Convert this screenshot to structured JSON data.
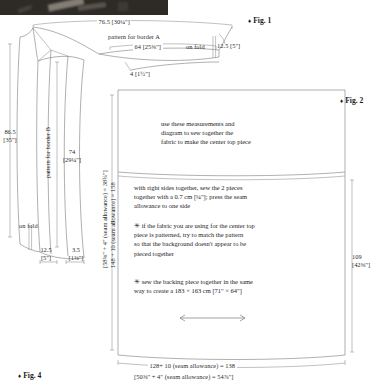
{
  "figure": {
    "doc_kind": "sewing-pattern-diagram",
    "photo_caption": "",
    "fig1_label": "Fig. 1",
    "fig2_label": "Fig. 2",
    "fig4_label": "Fig. 4",
    "bullet_glyph": "♦"
  },
  "border_a": {
    "title": "pattern for border A",
    "top_width": "76.5 [30¼\"]",
    "inner_width": "64 [25⅜\"]",
    "on_fold": "on fold",
    "fold_width": "12.5 [5\"]",
    "notch": "4 [1½\"]"
  },
  "border_b": {
    "title": "pattern for border B",
    "outer_height_line1": "86.5",
    "outer_height_line2": "[35\"]",
    "inner_height_line1": "74",
    "inner_height_line2": "[29¼\"]",
    "on_fold": "on fold",
    "left_width_line1": "12.5",
    "left_width_line2": "[5\"]",
    "right_width_line1": "3.5",
    "right_width_line2": "[1⅜\"]"
  },
  "center_top": {
    "height_metric": "148 + 10 (seam allowance) = 158",
    "height_imperial": "[58⅜\" + 4\" (seam allowance) = 38¾\"]",
    "bottom_metric": "128+ 10 (seam allowance) = 138",
    "bottom_imperial": "[50⅝\" + 4\" (seam allowance) = 54⅞\"]",
    "right_height_line1": "109",
    "right_height_line2": "[42⅜\"]",
    "note_1": "use these measurements and\ndiagram to sew together the\nfabric to make the center top piece",
    "note_2": "with right sides together, sew the 2 pieces\ntogether with a 0.7 cm [¼\"]; press the seam\nallowance to one side",
    "note_3": "✳ if the fabric you are using for the center top\npiece is patterned, try to match the pattern\nso that the background doesn't appear to be\npieced together",
    "note_4": "✳ sew the backing piece together in the same\nway to create a 183 × 163 cm [71\" × 64\"]"
  },
  "colors": {
    "ink": "#2b2b2b",
    "line": "#8e8e8e",
    "paper": "#ffffff"
  }
}
